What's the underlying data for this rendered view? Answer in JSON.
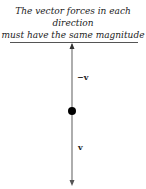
{
  "caption": {
    "line1": "The vector forces in each direction",
    "line2": "must have the same magnitude"
  },
  "labels": {
    "up": "−v",
    "down": "v"
  },
  "colors": {
    "line": "#555555",
    "dot": "#000000"
  }
}
